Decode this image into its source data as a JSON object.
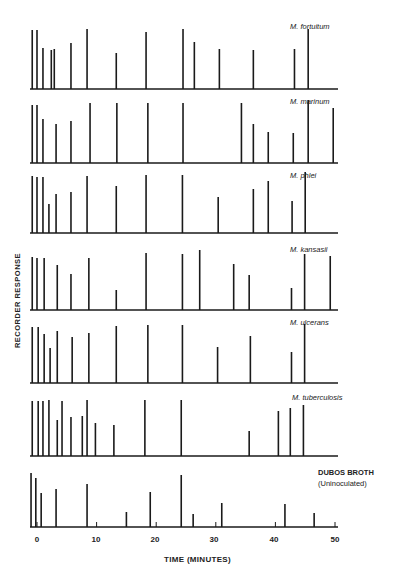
{
  "chart_data": {
    "type": "bar",
    "subtype": "chromatogram-stick-plot",
    "title": "",
    "xlabel": "TIME (MINUTES)",
    "ylabel": "RECORDER RESPONSE",
    "xlim": [
      0,
      50
    ],
    "xticks": [
      0,
      10,
      20,
      30,
      40,
      50
    ],
    "grid": false,
    "legend": "none (panel labels at right)",
    "height_units": "relative recorder response (pixel height above baseline)",
    "panels": [
      {
        "name": "M. fortuitum",
        "label_bold": false,
        "peaks": [
          [
            -0.8,
            59
          ],
          [
            0,
            59
          ],
          [
            1,
            41
          ],
          [
            2.4,
            39
          ],
          [
            2.9,
            40
          ],
          [
            5.7,
            46
          ],
          [
            8.4,
            60
          ],
          [
            13.3,
            36
          ],
          [
            18.3,
            57
          ],
          [
            24.5,
            60
          ],
          [
            26.4,
            47
          ],
          [
            30.6,
            40
          ],
          [
            36.3,
            39
          ],
          [
            43.2,
            40
          ],
          [
            45.5,
            60
          ]
        ]
      },
      {
        "name": "M. marinum",
        "label_bold": false,
        "peaks": [
          [
            -0.8,
            58
          ],
          [
            0,
            58
          ],
          [
            1,
            44
          ],
          [
            3.2,
            39
          ],
          [
            5.7,
            42
          ],
          [
            8.9,
            60
          ],
          [
            13.4,
            60
          ],
          [
            18.6,
            60
          ],
          [
            24.5,
            60
          ],
          [
            34.3,
            60
          ],
          [
            36.3,
            39
          ],
          [
            38.8,
            31
          ],
          [
            43,
            30
          ],
          [
            45.5,
            63
          ],
          [
            49.7,
            55
          ]
        ]
      },
      {
        "name": "M. phlei",
        "label_bold": false,
        "peaks": [
          [
            -0.8,
            57
          ],
          [
            0,
            56
          ],
          [
            1,
            56
          ],
          [
            2,
            29
          ],
          [
            3.2,
            39
          ],
          [
            5.7,
            41
          ],
          [
            8.4,
            57
          ],
          [
            13.3,
            47
          ],
          [
            18.3,
            58
          ],
          [
            24.4,
            58
          ],
          [
            30.4,
            36
          ],
          [
            36.3,
            44
          ],
          [
            38.8,
            52
          ],
          [
            42.8,
            32
          ],
          [
            45,
            61
          ]
        ]
      },
      {
        "name": "M. kansasii",
        "label_bold": false,
        "peaks": [
          [
            -0.8,
            53
          ],
          [
            0,
            52
          ],
          [
            1.2,
            52
          ],
          [
            3.4,
            45
          ],
          [
            5.7,
            36
          ],
          [
            8.7,
            52
          ],
          [
            13.3,
            20
          ],
          [
            18.3,
            57
          ],
          [
            24.4,
            56
          ],
          [
            27.3,
            60
          ],
          [
            33,
            46
          ],
          [
            35.6,
            35
          ],
          [
            42.7,
            22
          ],
          [
            44.9,
            56
          ],
          [
            49.2,
            54
          ]
        ]
      },
      {
        "name": "M. ulcerans",
        "label_bold": false,
        "peaks": [
          [
            -0.8,
            56
          ],
          [
            0.2,
            56
          ],
          [
            1.2,
            49
          ],
          [
            2.2,
            35
          ],
          [
            3.4,
            52
          ],
          [
            5.9,
            46
          ],
          [
            8.7,
            50
          ],
          [
            13.3,
            57
          ],
          [
            18.6,
            58
          ],
          [
            24.4,
            58
          ],
          [
            30.3,
            36
          ],
          [
            35.8,
            47
          ],
          [
            42.7,
            31
          ],
          [
            44.9,
            59
          ]
        ]
      },
      {
        "name": "M. tuberculosis",
        "label_bold": false,
        "peaks": [
          [
            -0.8,
            55
          ],
          [
            0.2,
            55
          ],
          [
            1,
            55
          ],
          [
            2,
            56
          ],
          [
            3.4,
            36
          ],
          [
            4.2,
            55
          ],
          [
            5.7,
            39
          ],
          [
            7.6,
            40
          ],
          [
            8.4,
            56
          ],
          [
            9.8,
            33
          ],
          [
            12.9,
            31
          ],
          [
            18.1,
            56
          ],
          [
            24.2,
            56
          ],
          [
            35.6,
            25
          ],
          [
            40.5,
            45
          ],
          [
            42.5,
            48
          ],
          [
            44.7,
            51
          ]
        ]
      },
      {
        "name": "DUBOS BROTH",
        "sublabel": "(Uninoculated)",
        "label_bold": true,
        "peaks": [
          [
            -1,
            54
          ],
          [
            -0.2,
            49
          ],
          [
            0.7,
            34
          ],
          [
            3.2,
            38
          ],
          [
            8.4,
            43
          ],
          [
            15,
            15
          ],
          [
            19,
            35
          ],
          [
            24.2,
            52
          ],
          [
            26.2,
            13
          ],
          [
            31,
            24
          ],
          [
            41.6,
            23
          ],
          [
            46.5,
            14
          ]
        ]
      }
    ]
  },
  "axis": {
    "tick_labels": [
      "0",
      "10",
      "20",
      "30",
      "40",
      "50"
    ]
  },
  "colors": {
    "ink": "#1a1a1a",
    "background": "#ffffff"
  }
}
